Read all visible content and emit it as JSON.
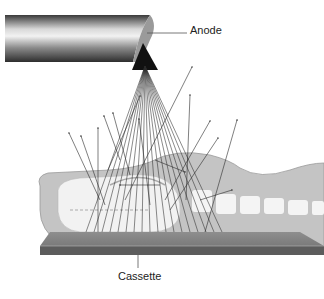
{
  "diagram": {
    "labels": {
      "anode": "Anode",
      "cassette": "Cassette"
    },
    "components": [
      {
        "id": "xray-tube",
        "description": "Cylindrical X-ray tube with angled anode end"
      },
      {
        "id": "primary-beam",
        "description": "Fan of primary x-ray beams diverging from anode focal spot"
      },
      {
        "id": "patient-body",
        "description": "Gray silhouette of patient lying on cassette with skeletal structures"
      },
      {
        "id": "scatter-rays",
        "description": "Scattered radiation arrows originating inside the patient"
      },
      {
        "id": "cassette",
        "description": "Flat image receptor plate beneath patient"
      }
    ],
    "colors": {
      "tube_dark": "#3a3a3a",
      "tube_light": "#e8e8e8",
      "body_fill": "#c4c4c4",
      "bone_fill": "#f4f4f4",
      "cassette_top": "#8a8a8a",
      "cassette_edge": "#5c5c5c",
      "ray": "#2a2a2a"
    }
  }
}
